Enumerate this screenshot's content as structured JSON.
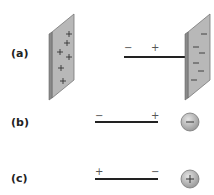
{
  "figure": {
    "rows": [
      {
        "label": "(a)",
        "rod": {
          "left_sign": "−",
          "right_sign": "+"
        },
        "left_object": {
          "type": "plate",
          "charge_sign": "+",
          "charge_count": 6
        },
        "right_object": {
          "type": "plate",
          "charge_sign": "−",
          "charge_count": 6
        }
      },
      {
        "label": "(b)",
        "rod": {
          "left_sign": "−",
          "right_sign": "+"
        },
        "right_object": {
          "type": "sphere",
          "charge_sign": "−"
        }
      },
      {
        "label": "(c)",
        "rod": {
          "left_sign": "+",
          "right_sign": "−"
        },
        "right_object": {
          "type": "sphere",
          "charge_sign": "+"
        }
      }
    ],
    "colors": {
      "plate_face": "#b8b8b8",
      "plate_edge": "#8a8a8a",
      "sphere_fill": "#c4c4c4",
      "rod": "#222222",
      "text": "#222222"
    }
  }
}
